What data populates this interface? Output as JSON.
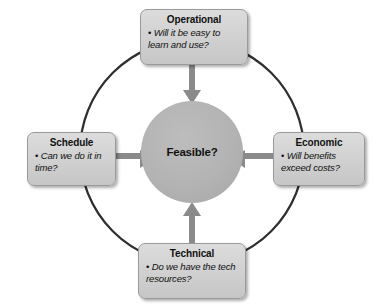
{
  "diagram": {
    "center": {
      "label": "Feasible?",
      "shape": "circle",
      "fill": "#b3b3b3"
    },
    "ring": {
      "shape": "circle-outline",
      "stroke": "#2e2e2e"
    },
    "colors": {
      "box_fill": "#d2d2d2",
      "box_border": "#9a9a9a",
      "arrow": "#8a8a8a",
      "ring_stroke": "#2e2e2e",
      "text": "#111111",
      "background": "#ffffff"
    },
    "bullet_glyph": "•",
    "nodes": [
      {
        "id": "operational",
        "title": "Operational",
        "question": "Will it be easy to learn and use?",
        "position": "top",
        "arrow_direction": "down"
      },
      {
        "id": "schedule",
        "title": "Schedule",
        "question": "Can we do it in time?",
        "position": "left",
        "arrow_direction": "right"
      },
      {
        "id": "economic",
        "title": "Economic",
        "question": "Will benefits exceed costs?",
        "position": "right",
        "arrow_direction": "left"
      },
      {
        "id": "technical",
        "title": "Technical",
        "question": "Do we have the tech resources?",
        "position": "bottom",
        "arrow_direction": "up"
      }
    ]
  }
}
